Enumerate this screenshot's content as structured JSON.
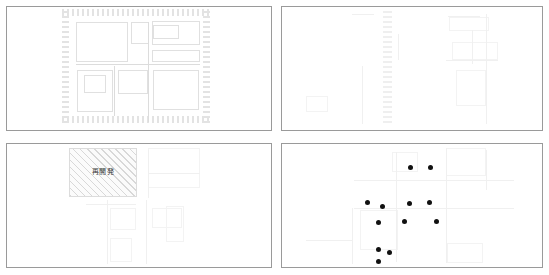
{
  "figure": {
    "width": 549,
    "height": 275,
    "background_color": "#ffffff",
    "panel_border_color": "#9a9a9a",
    "layout": "2x2 grid of map panels"
  },
  "panels": [
    {
      "id": "panel-top-left",
      "position": "top-left",
      "x": 6,
      "y": 6,
      "width": 266,
      "height": 125,
      "description": "city block map with dashed boundary ring",
      "annotation_type": "hatched-boundary-ring",
      "label": ""
    },
    {
      "id": "panel-top-right",
      "position": "top-right",
      "x": 281,
      "y": 6,
      "width": 262,
      "height": 125,
      "description": "city block map with faint vertical hatched corridor strip",
      "annotation_type": "hatched-vertical-strip",
      "label": ""
    },
    {
      "id": "panel-bottom-left",
      "position": "bottom-left",
      "x": 6,
      "y": 143,
      "width": 266,
      "height": 125,
      "description": "city block map with diagonally hatched redevelopment block",
      "annotation_type": "hatched-area-block",
      "label": "再開発"
    },
    {
      "id": "panel-bottom-right",
      "position": "bottom-right",
      "x": 281,
      "y": 143,
      "width": 262,
      "height": 125,
      "description": "city block map overlaid with black point markers",
      "annotation_type": "point-markers",
      "label": ""
    }
  ],
  "labels": {
    "redevelopment": "再開発"
  },
  "chart_data": {
    "type": "scatter",
    "title": "",
    "xlabel": "",
    "ylabel": "",
    "grid": false,
    "legend": "none",
    "panel": "panel-bottom-right",
    "marker_color": "#111111",
    "marker_radius_px": 2.5,
    "count": 12,
    "points": [
      {
        "x": 410,
        "y": 167
      },
      {
        "x": 430,
        "y": 167
      },
      {
        "x": 367,
        "y": 202
      },
      {
        "x": 382,
        "y": 206
      },
      {
        "x": 409,
        "y": 203
      },
      {
        "x": 429,
        "y": 202
      },
      {
        "x": 378,
        "y": 222
      },
      {
        "x": 404,
        "y": 221
      },
      {
        "x": 436,
        "y": 221
      },
      {
        "x": 378,
        "y": 249
      },
      {
        "x": 389,
        "y": 252
      },
      {
        "x": 378,
        "y": 261
      }
    ]
  },
  "map_geometry": {
    "panel1": {
      "ring": {
        "x": 62,
        "y": 9,
        "width": 148,
        "height": 114
      },
      "rects": [
        {
          "x": 76,
          "y": 22,
          "w": 52,
          "h": 40
        },
        {
          "x": 131,
          "y": 22,
          "w": 18,
          "h": 22
        },
        {
          "x": 152,
          "y": 21,
          "w": 48,
          "h": 24
        },
        {
          "x": 153,
          "y": 25,
          "w": 26,
          "h": 14
        },
        {
          "x": 84,
          "y": 75,
          "w": 22,
          "h": 18
        },
        {
          "x": 77,
          "y": 70,
          "w": 36,
          "h": 42
        },
        {
          "x": 118,
          "y": 70,
          "w": 30,
          "h": 24
        },
        {
          "x": 153,
          "y": 70,
          "w": 46,
          "h": 40
        },
        {
          "x": 152,
          "y": 50,
          "w": 48,
          "h": 12
        }
      ],
      "lines": [
        {
          "x": 76,
          "y": 64,
          "w": 124,
          "h": 1
        },
        {
          "x": 148,
          "y": 22,
          "w": 1,
          "h": 100
        },
        {
          "x": 114,
          "y": 66,
          "w": 1,
          "h": 50
        }
      ]
    },
    "panel2": {
      "strip": {
        "x": 383,
        "y": 9,
        "width": 9,
        "height": 114
      },
      "rects": [
        {
          "x": 452,
          "y": 42,
          "w": 46,
          "h": 18
        },
        {
          "x": 449,
          "y": 17,
          "w": 40,
          "h": 14
        },
        {
          "x": 456,
          "y": 70,
          "w": 30,
          "h": 36
        },
        {
          "x": 306,
          "y": 96,
          "w": 22,
          "h": 16
        }
      ],
      "lines": [
        {
          "x": 352,
          "y": 14,
          "w": 22,
          "h": 1
        },
        {
          "x": 448,
          "y": 16,
          "w": 32,
          "h": 1
        },
        {
          "x": 446,
          "y": 60,
          "w": 52,
          "h": 1
        },
        {
          "x": 362,
          "y": 66,
          "w": 1,
          "h": 58
        },
        {
          "x": 472,
          "y": 30,
          "w": 1,
          "h": 34
        },
        {
          "x": 486,
          "y": 14,
          "w": 1,
          "h": 110
        },
        {
          "x": 398,
          "y": 34,
          "w": 1,
          "h": 26
        }
      ]
    },
    "panel3": {
      "block": {
        "x": 69,
        "y": 148,
        "width": 68,
        "height": 49
      },
      "rects": [
        {
          "x": 148,
          "y": 148,
          "w": 52,
          "h": 40
        },
        {
          "x": 110,
          "y": 208,
          "w": 26,
          "h": 22
        },
        {
          "x": 110,
          "y": 238,
          "w": 22,
          "h": 24
        },
        {
          "x": 152,
          "y": 208,
          "w": 30,
          "h": 20
        },
        {
          "x": 166,
          "y": 206,
          "w": 18,
          "h": 36
        }
      ],
      "lines": [
        {
          "x": 148,
          "y": 173,
          "w": 52,
          "h": 1
        },
        {
          "x": 148,
          "y": 150,
          "w": 1,
          "h": 48
        },
        {
          "x": 107,
          "y": 200,
          "w": 1,
          "h": 64
        },
        {
          "x": 146,
          "y": 200,
          "w": 1,
          "h": 64
        },
        {
          "x": 86,
          "y": 204,
          "w": 50,
          "h": 1
        }
      ]
    },
    "panel4": {
      "rects": [
        {
          "x": 392,
          "y": 152,
          "w": 26,
          "h": 20
        },
        {
          "x": 446,
          "y": 148,
          "w": 40,
          "h": 28
        },
        {
          "x": 360,
          "y": 210,
          "w": 38,
          "h": 40
        },
        {
          "x": 447,
          "y": 243,
          "w": 36,
          "h": 20
        }
      ],
      "lines": [
        {
          "x": 354,
          "y": 180,
          "w": 160,
          "h": 1
        },
        {
          "x": 354,
          "y": 208,
          "w": 160,
          "h": 1
        },
        {
          "x": 396,
          "y": 152,
          "w": 1,
          "h": 110
        },
        {
          "x": 446,
          "y": 148,
          "w": 1,
          "h": 115
        },
        {
          "x": 486,
          "y": 150,
          "w": 1,
          "h": 40
        },
        {
          "x": 306,
          "y": 240,
          "w": 46,
          "h": 1
        },
        {
          "x": 352,
          "y": 208,
          "w": 1,
          "h": 56
        }
      ]
    }
  }
}
